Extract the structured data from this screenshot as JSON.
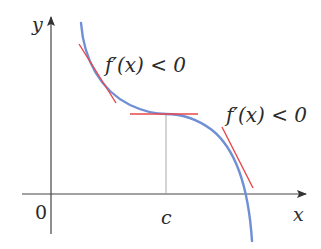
{
  "figure": {
    "type": "function-graph",
    "axes": {
      "x_label": "x",
      "y_label": "y",
      "origin_label": "0",
      "tick_label_c": "c"
    },
    "annotations": {
      "left_label": "f′(x) < 0",
      "right_label": "f′(x) < 0"
    },
    "colors": {
      "curve": "#6f8fd6",
      "tangent": "#e8474a",
      "axis": "#333333",
      "guide_line": "#9a9a9a",
      "text": "#2b2b2b"
    },
    "tangents": [
      {
        "name": "left-tangent",
        "slope": "negative"
      },
      {
        "name": "horizontal-tangent-at-c",
        "slope": "zero"
      },
      {
        "name": "right-tangent",
        "slope": "negative"
      }
    ]
  }
}
